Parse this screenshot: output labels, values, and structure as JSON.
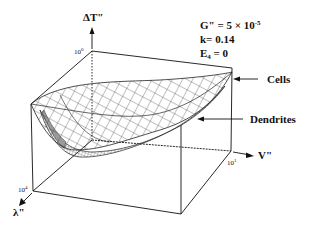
{
  "figure": {
    "type": "3d-surface-plot",
    "axes": {
      "z": {
        "label": "ΔT\"",
        "tick": "10",
        "tick_exp": "0"
      },
      "y": {
        "label": "λ\"",
        "tick": "10",
        "tick_exp": "4"
      },
      "x": {
        "label": "V\"",
        "tick": "10",
        "tick_exp": "1"
      }
    },
    "parameters": {
      "G_label": "G\" = ",
      "G_value": "5 × 10",
      "G_exp": "-5",
      "k_label": "k= ",
      "k_value": "0.14",
      "E_label": "E",
      "E_sub": "4",
      "E_value": " = 0"
    },
    "annotations": {
      "upper_surface": "Cells",
      "lower_surface": "Dendrites"
    },
    "colors": {
      "line": "#111111",
      "mesh": "#333333",
      "dendrite_fill": "#9a9a9a",
      "background": "#ffffff"
    }
  }
}
